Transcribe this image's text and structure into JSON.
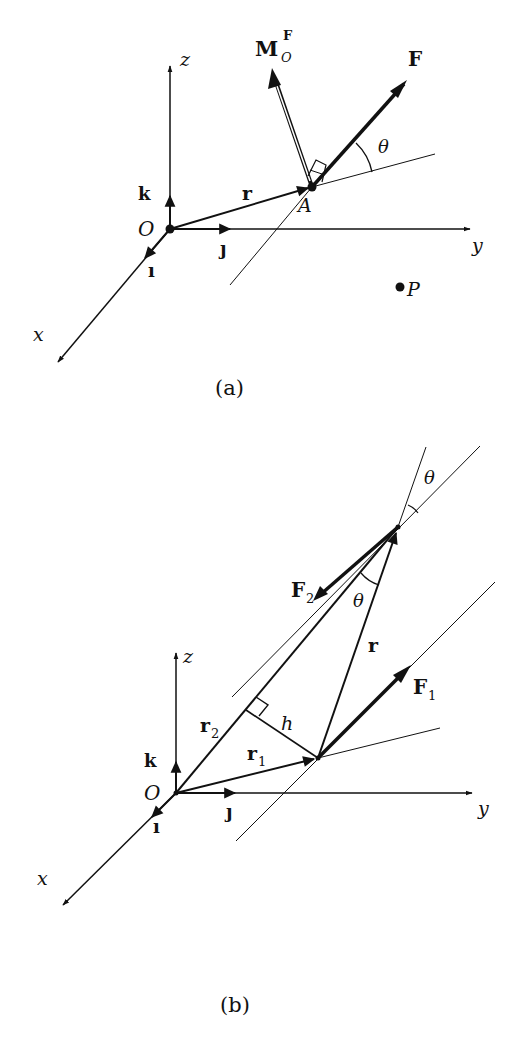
{
  "figure_a": {
    "caption": "(a)",
    "axes": {
      "x": "x",
      "y": "y",
      "z": "z"
    },
    "unit_vectors": {
      "i": "ı",
      "j": "ȷ",
      "k": "k"
    },
    "origin": "O",
    "point_A": "A",
    "point_P": "P",
    "position_vector": "r",
    "force": "F",
    "moment_main": "M",
    "moment_sub": "O",
    "moment_sup": "F",
    "angle": "θ"
  },
  "figure_b": {
    "caption": "(b)",
    "axes": {
      "x": "x",
      "y": "y",
      "z": "z"
    },
    "unit_vectors": {
      "i": "ı",
      "j": "ȷ",
      "k": "k"
    },
    "origin": "O",
    "position_vector": "r",
    "r1_main": "r",
    "r1_sub": "1",
    "r2_main": "r",
    "r2_sub": "2",
    "f1_main": "F",
    "f1_sub": "1",
    "f2_main": "F",
    "f2_sub": "2",
    "distance": "h",
    "angle_top": "θ",
    "angle_inner": "θ"
  },
  "colors": {
    "ink": "#111111",
    "background": "#ffffff"
  }
}
